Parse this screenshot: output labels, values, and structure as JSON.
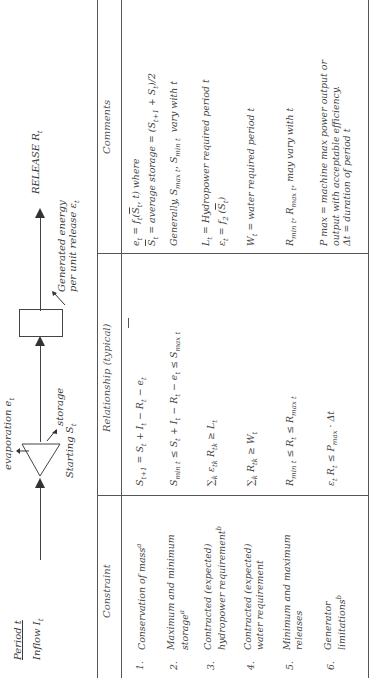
{
  "diagram": {
    "period_label": "Period t",
    "inflow_label": "Inflow I",
    "inflow_sub": "t",
    "evaporation_label": "evaporation e",
    "evaporation_sub": "t",
    "storage_label": "storage",
    "starting_label": "Starting S",
    "starting_sub": "t",
    "energy_label_line1": "Generated energy",
    "energy_label_line2": "per unit release ε",
    "energy_sub": "t",
    "release_label": "RELEASE R",
    "release_sub": "t"
  },
  "table": {
    "headers": {
      "constraint": "Constraint",
      "relationship": "Relationship (typical)",
      "comments": "Comments"
    },
    "rows": [
      {
        "number": "1.",
        "constraint_line1": "Conservation of mass",
        "constraint_sup": "a",
        "constraint_line2": "",
        "relationship": "S t+1 = S t + I t − R t − e t",
        "comments_line1": "e t = f t (S̅ t , t) where",
        "comments_line2": "S̅ t = average storage = (S t+1 + S t)/2"
      },
      {
        "number": "2.",
        "constraint_line1": "Maximum and minimum",
        "constraint_line2": "storage",
        "constraint_sup": "a",
        "relationship": "S min t ≤ S t + I t − R t − e t ≤ S max t",
        "comments_line1": "Generally, S max t , S min t  vary with t",
        "comments_line2": ""
      },
      {
        "number": "3.",
        "constraint_line1": "Contracted (expected)",
        "constraint_line2": "hydropower requirement",
        "constraint_sup": "b",
        "relationship": "∑k ε tk R tk ≥ L t",
        "comments_line1": "L t = Hydropower required period t",
        "comments_line2": "ε t = f 2 (S̅ t)"
      },
      {
        "number": "4.",
        "constraint_line1": "Contracted (expected)",
        "constraint_line2": "water requirement",
        "constraint_sup": "",
        "relationship": "∑k R tk ≥ W t",
        "comments_line1": "W t = water required period t",
        "comments_line2": ""
      },
      {
        "number": "5.",
        "constraint_line1": "Minimum and maximum",
        "constraint_line2": "releases",
        "constraint_sup": "",
        "relationship": "R min t ≤ R t ≤ R max t",
        "comments_line1": "R min t , R max t , may vary with t",
        "comments_line2": ""
      },
      {
        "number": "6.",
        "constraint_line1": "Generator",
        "constraint_line2": "limitations",
        "constraint_sup": "b",
        "relationship": "ε t R t ≤ P max · Δt",
        "comments_line1": "P max = machine max power output or",
        "comments_line2": "output with acceptable efficiency.",
        "comments_line3": "Δt = duration of period t"
      }
    ]
  }
}
